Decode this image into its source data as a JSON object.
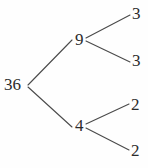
{
  "diagram": {
    "type": "factor-tree",
    "stroke_color": "#4a4a4a",
    "text_color": "#2b2b2b",
    "background_color": "#fefefe",
    "nodes": {
      "root": "36",
      "branch_upper": "9",
      "branch_lower": "4",
      "leaf_1": "3",
      "leaf_2": "3",
      "leaf_3": "2",
      "leaf_4": "2"
    },
    "edges": [
      {
        "name": "root-to-upper",
        "from": "36",
        "to": "9"
      },
      {
        "name": "root-to-lower",
        "from": "36",
        "to": "4"
      },
      {
        "name": "upper-to-leaf1",
        "from": "9",
        "to": "3"
      },
      {
        "name": "upper-to-leaf2",
        "from": "9",
        "to": "3"
      },
      {
        "name": "lower-to-leaf3",
        "from": "4",
        "to": "2"
      },
      {
        "name": "lower-to-leaf4",
        "from": "4",
        "to": "2"
      }
    ]
  }
}
